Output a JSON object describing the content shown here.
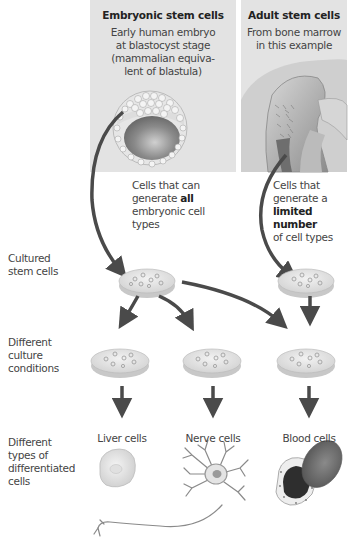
{
  "columns": {
    "embryonic": {
      "title": "Embryonic stem cells",
      "description_lines": [
        "Early human embryo",
        "at blastocyst stage",
        "(mammalian equiva-",
        "lent of blastula)"
      ],
      "note_lines": [
        "Cells that can",
        "generate ",
        "all",
        "embryonic cell",
        "types"
      ]
    },
    "adult": {
      "title": "Adult stem cells",
      "description_lines": [
        "From bone marrow",
        "in this example"
      ],
      "note_lines": [
        "Cells that",
        "generate a",
        "limited number",
        "of cell types"
      ]
    }
  },
  "row_labels": {
    "cultured": [
      "Cultured",
      "stem cells"
    ],
    "conditions": [
      "Different",
      "culture",
      "conditions"
    ],
    "differentiated": [
      "Different",
      "types of",
      "differentiated",
      "cells"
    ]
  },
  "cell_types": [
    {
      "label": "Liver cells",
      "icon": "liver-cell-icon"
    },
    {
      "label": "Nerve cells",
      "icon": "nerve-cell-icon"
    },
    {
      "label": "Blood cells",
      "icon": "blood-cell-icon"
    }
  ],
  "colors": {
    "box_bg": "#e3e3e3",
    "arrow": "#4a4a4a",
    "dish": "#e8e8e8"
  }
}
